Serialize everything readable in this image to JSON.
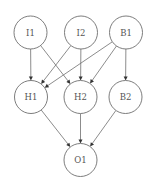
{
  "diagram": {
    "type": "neural-network",
    "nodes": [
      {
        "id": "I1",
        "label": "I1",
        "layer": "input"
      },
      {
        "id": "I2",
        "label": "I2",
        "layer": "input"
      },
      {
        "id": "B1",
        "label": "B1",
        "layer": "input-bias"
      },
      {
        "id": "H1",
        "label": "H1",
        "layer": "hidden"
      },
      {
        "id": "H2",
        "label": "H2",
        "layer": "hidden"
      },
      {
        "id": "B2",
        "label": "B2",
        "layer": "hidden-bias"
      },
      {
        "id": "O1",
        "label": "O1",
        "layer": "output"
      }
    ],
    "edges": [
      {
        "from": "I1",
        "to": "H1"
      },
      {
        "from": "I1",
        "to": "H2"
      },
      {
        "from": "I2",
        "to": "H1"
      },
      {
        "from": "I2",
        "to": "H2"
      },
      {
        "from": "B1",
        "to": "H1"
      },
      {
        "from": "B1",
        "to": "H2"
      },
      {
        "from": "B1",
        "to": "B2"
      },
      {
        "from": "H1",
        "to": "O1"
      },
      {
        "from": "H2",
        "to": "O1"
      },
      {
        "from": "B2",
        "to": "O1"
      }
    ]
  }
}
